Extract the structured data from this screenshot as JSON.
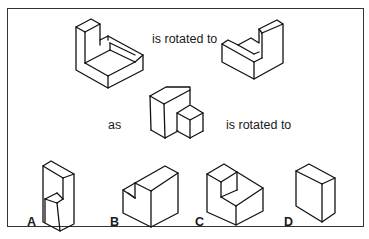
{
  "puzzle": {
    "row1": {
      "connector": "is rotated to"
    },
    "row2": {
      "prefix": "as",
      "connector": "is rotated to"
    },
    "options": [
      {
        "label": "A"
      },
      {
        "label": "B"
      },
      {
        "label": "C"
      },
      {
        "label": "D"
      }
    ]
  },
  "colors": {
    "stroke": "#111111",
    "background": "#ffffff",
    "frame": "#333333"
  }
}
